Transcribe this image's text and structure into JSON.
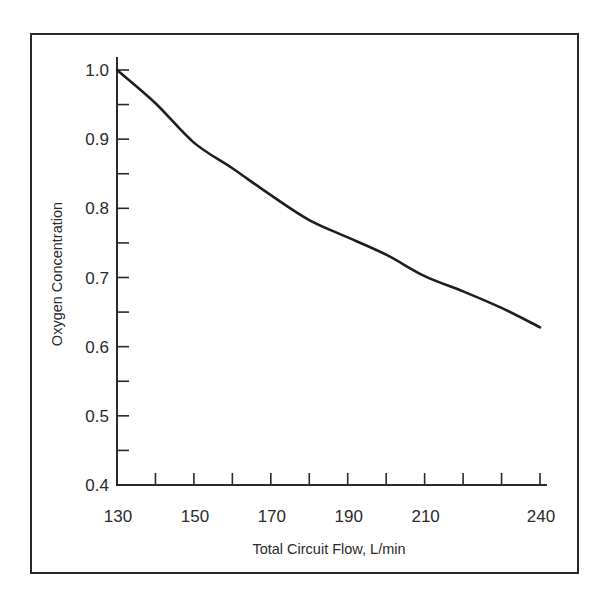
{
  "chart_data": {
    "type": "line",
    "title": "",
    "xlabel": "Total Circuit Flow, L/min",
    "ylabel": "Oxygen Concentration",
    "xlim": [
      130,
      240
    ],
    "ylim": [
      0.4,
      1.0
    ],
    "x_tick_labels": [
      "130",
      "150",
      "170",
      "190",
      "210",
      "240"
    ],
    "x_tick_values": [
      130,
      150,
      170,
      190,
      210,
      240
    ],
    "x_minor_ticks": [
      140,
      150,
      160,
      170,
      180,
      190,
      200,
      210,
      220,
      230,
      240
    ],
    "y_tick_labels": [
      "0.4",
      "0.5",
      "0.6",
      "0.7",
      "0.8",
      "0.9",
      "1.0"
    ],
    "y_tick_values": [
      0.4,
      0.5,
      0.6,
      0.7,
      0.8,
      0.9,
      1.0
    ],
    "y_minor_ticks": [
      0.45,
      0.5,
      0.55,
      0.6,
      0.65,
      0.7,
      0.75,
      0.8,
      0.85,
      0.9,
      0.95,
      1.0
    ],
    "grid": false,
    "legend": null,
    "series": [
      {
        "name": "Oxygen Concentration",
        "x": [
          130,
          140,
          150,
          160,
          170,
          180,
          190,
          200,
          210,
          220,
          230,
          240
        ],
        "values": [
          1.0,
          0.952,
          0.895,
          0.858,
          0.819,
          0.783,
          0.758,
          0.733,
          0.702,
          0.68,
          0.656,
          0.628
        ]
      }
    ]
  }
}
